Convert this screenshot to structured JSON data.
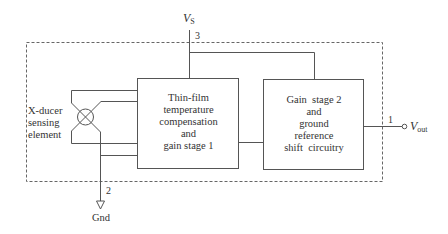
{
  "diagram": {
    "type": "block-diagram",
    "supply": {
      "symbol": "V",
      "subscript": "S",
      "pin": "3"
    },
    "ground": {
      "label": "Gnd",
      "pin": "2"
    },
    "output": {
      "symbol": "V",
      "subscript": "out",
      "pin": "1"
    },
    "sensing_element": {
      "lines": [
        "X-ducer",
        "sensing",
        "element"
      ]
    },
    "block1": {
      "lines": [
        "Thin-film",
        "temperature",
        "compensation",
        "and",
        "gain stage 1"
      ]
    },
    "block2": {
      "lines": [
        "Gain  stage 2",
        "and",
        "ground",
        "reference",
        "shift  circuitry"
      ]
    },
    "colors": {
      "line": "#555555",
      "dashed_border": "#666666",
      "text": "#333333"
    }
  }
}
